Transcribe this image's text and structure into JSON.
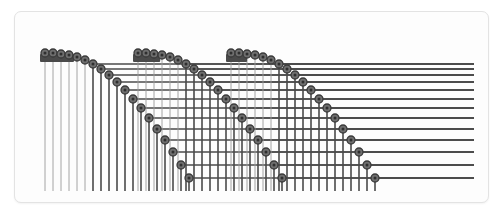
{
  "colors": {
    "page_background": "#ffffff",
    "card_background": "#fdfdfd",
    "card_border": "#e3e3e3",
    "node_fill": "#6e6e6e",
    "node_stroke": "#3a3a3a",
    "line_color": "#4a4a4a",
    "thin_line_color": "#9a9a9a",
    "bar_fill": "#4a4a4a"
  },
  "geometry": {
    "card": {
      "x": 14,
      "y": 11,
      "width": 473,
      "height": 190,
      "radius": 7
    },
    "plot": {
      "left": 26,
      "top": 28,
      "right": 462,
      "bottom": 178
    },
    "node_radius": 4.0,
    "node_inner_radius": 1.5,
    "line_width_major": 1.6,
    "line_width_minor": 0.9,
    "bar": {
      "width": 34,
      "height": 8,
      "radius": 1
    }
  },
  "chart_data": {
    "type": "scatter",
    "xlabel": "",
    "ylabel": "",
    "grid": true,
    "legend": null,
    "arc_count": 3,
    "nodes_per_arc": 19,
    "arc_pitch_x": 93,
    "arc_start_x": 32,
    "arc_top_y": 41,
    "arc_span_x": 150,
    "arc_span_y": 130,
    "bars": [
      {
        "arc": 0,
        "x": 31,
        "y": 46,
        "nodes_on_bar": 3
      },
      {
        "arc": 1,
        "x": 124,
        "y": 46,
        "nodes_on_bar": 2
      },
      {
        "arc": 2,
        "x": 217,
        "y": 46,
        "nodes_on_bar": 1
      }
    ],
    "arcs": [
      {
        "name": "arc-1",
        "points": [
          [
            32,
            41
          ],
          [
            40,
            41
          ],
          [
            48,
            42
          ],
          [
            56,
            43
          ],
          [
            64,
            45
          ],
          [
            72,
            48
          ],
          [
            80,
            52
          ],
          [
            88,
            57
          ],
          [
            96,
            63
          ],
          [
            104,
            70
          ],
          [
            112,
            78
          ],
          [
            120,
            87
          ],
          [
            128,
            96
          ],
          [
            136,
            106
          ],
          [
            144,
            117
          ],
          [
            152,
            128
          ],
          [
            160,
            140
          ],
          [
            168,
            153
          ],
          [
            176,
            166
          ]
        ]
      },
      {
        "name": "arc-2",
        "points": [
          [
            125,
            41
          ],
          [
            133,
            41
          ],
          [
            141,
            42
          ],
          [
            149,
            43
          ],
          [
            157,
            45
          ],
          [
            165,
            48
          ],
          [
            173,
            52
          ],
          [
            181,
            57
          ],
          [
            189,
            63
          ],
          [
            197,
            70
          ],
          [
            205,
            78
          ],
          [
            213,
            87
          ],
          [
            221,
            96
          ],
          [
            229,
            106
          ],
          [
            237,
            117
          ],
          [
            245,
            128
          ],
          [
            253,
            140
          ],
          [
            261,
            153
          ],
          [
            269,
            166
          ]
        ]
      },
      {
        "name": "arc-3",
        "points": [
          [
            218,
            41
          ],
          [
            226,
            41
          ],
          [
            234,
            42
          ],
          [
            242,
            43
          ],
          [
            250,
            45
          ],
          [
            258,
            48
          ],
          [
            266,
            52
          ],
          [
            274,
            57
          ],
          [
            282,
            63
          ],
          [
            290,
            70
          ],
          [
            298,
            78
          ],
          [
            306,
            87
          ],
          [
            314,
            96
          ],
          [
            322,
            106
          ],
          [
            330,
            117
          ],
          [
            338,
            128
          ],
          [
            346,
            140
          ],
          [
            354,
            153
          ],
          [
            362,
            166
          ]
        ]
      }
    ]
  }
}
